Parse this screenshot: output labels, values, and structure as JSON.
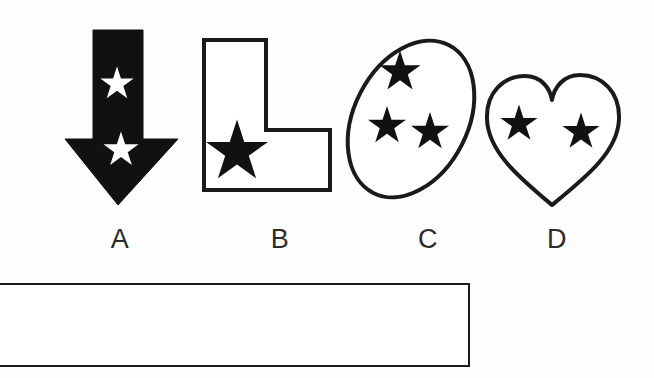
{
  "page": {
    "background_color": "#fefefe",
    "ink_color": "#111111",
    "width": 654,
    "height": 378
  },
  "question_type": "multiple-choice-figure",
  "options": [
    {
      "id": "A",
      "label": "A",
      "shape_name": "down-arrow",
      "fill": "solid-black",
      "fill_color": "#111111",
      "outline_color": "#111111",
      "star_count": 2,
      "star_color": "#ffffff",
      "star_description": "two white stars inside the solid black arrow, one on the shaft and one on the head"
    },
    {
      "id": "B",
      "label": "B",
      "shape_name": "l-shape",
      "fill": "white",
      "fill_color": "#ffffff",
      "outline_color": "#111111",
      "star_count": 1,
      "star_color": "#111111",
      "star_description": "one large black star at the lower-left, overlapping the left border"
    },
    {
      "id": "C",
      "label": "C",
      "shape_name": "tilted-ellipse",
      "fill": "white",
      "fill_color": "#ffffff",
      "outline_color": "#111111",
      "star_count": 3,
      "star_color": "#111111",
      "star_description": "three black stars, one upper-centre and two lower side by side"
    },
    {
      "id": "D",
      "label": "D",
      "shape_name": "heart",
      "fill": "white",
      "fill_color": "#ffffff",
      "outline_color": "#111111",
      "star_count": 2,
      "star_color": "#111111",
      "star_description": "two black stars side by side inside the heart"
    }
  ],
  "answer_box": {
    "name": "answer-rectangle",
    "text": "",
    "border_color": "#1c1c1c",
    "fill_color": "#ffffff",
    "clipped_left_edge": true
  }
}
